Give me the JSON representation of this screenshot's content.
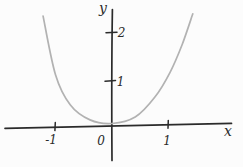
{
  "figure": {
    "background": "#fcfcfc",
    "axis_color": "#2b2b2b",
    "curve_color": "#b2b2b2"
  },
  "chart_data": {
    "type": "line",
    "title": "",
    "xlabel": "x",
    "ylabel": "y",
    "origin_label": "0",
    "grid": false,
    "legend": "none",
    "xlim": [
      -1.9,
      2.1
    ],
    "ylim": [
      -0.85,
      2.5
    ],
    "x_ticks": [
      {
        "value": -1,
        "label": "-1"
      },
      {
        "value": 1,
        "label": "1"
      }
    ],
    "y_ticks": [
      {
        "value": 1,
        "label": "1"
      },
      {
        "value": 2,
        "label": "2"
      }
    ],
    "series": [
      {
        "name": "parabola",
        "function": "y = x^2",
        "style": "hand-drawn gray curve",
        "x": [
          -1.22,
          -1.0,
          -0.74,
          -0.39,
          0,
          0.41,
          0.76,
          1.03,
          1.24,
          1.43
        ],
        "y": [
          2.36,
          1.07,
          0.41,
          0.08,
          0,
          0.14,
          0.58,
          1.13,
          1.73,
          2.41
        ]
      }
    ]
  }
}
